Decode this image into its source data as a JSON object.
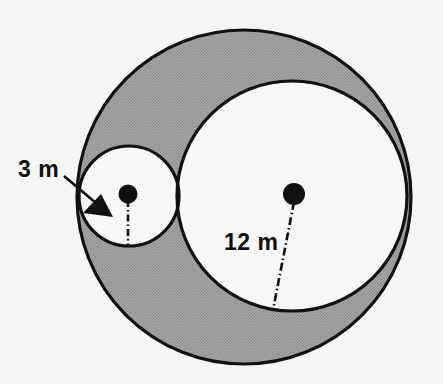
{
  "figure": {
    "background_color": "#f5f5f3",
    "shaded_color": "#9b9b9b",
    "unshaded_color": "#f7f7f5",
    "stroke_color": "#111111"
  },
  "labels": {
    "small_radius": "3 m",
    "large_radius": "12 m"
  },
  "shapes": {
    "outer_circle": {
      "name": "outer-circle",
      "center_x": 244,
      "center_y": 197,
      "radius": 167,
      "fill": "#9b9b9b",
      "stroke": "#111111"
    },
    "large_inner_circle": {
      "name": "large-inner-circle",
      "center_x": 292,
      "center_y": 196,
      "radius": 115,
      "fill": "#f7f7f5",
      "stroke": "#111111",
      "label": "12 m"
    },
    "small_inner_circle": {
      "name": "small-inner-circle",
      "center_x": 129,
      "center_y": 196,
      "radius": 50,
      "fill": "#f7f7f5",
      "stroke": "#111111",
      "label": "3 m"
    }
  },
  "markers": {
    "small_center_dot": {
      "cx": 128,
      "cy": 194,
      "r": 9.5
    },
    "large_center_dot": {
      "cx": 294,
      "cy": 194,
      "r": 11
    }
  },
  "leaders": {
    "small_radius_line": {
      "x1": 128,
      "y1": 200,
      "x2": 128,
      "y2": 246
    },
    "large_radius_line": {
      "x1": 294,
      "y1": 202,
      "x2": 273,
      "y2": 310
    },
    "arrow_shaft": {
      "x1": 64,
      "y1": 176,
      "x2": 105,
      "y2": 211
    },
    "arrow_head_points": "112,216 84,212 100,196"
  },
  "text_positions": {
    "small_radius_label": {
      "x": 18,
      "y": 177
    },
    "large_radius_label": {
      "x": 224,
      "y": 250
    }
  }
}
